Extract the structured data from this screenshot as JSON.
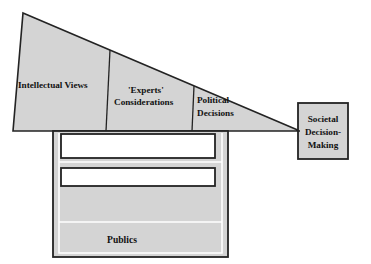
{
  "diagram": {
    "colors": {
      "fill_gray": "#d4d4d4",
      "stroke_dark": "#232323",
      "highlight_white": "#ffffff",
      "bar_fill": "#ffffff",
      "text": "#111111",
      "background": "#ffffff"
    },
    "wedge": {
      "name": "knowledge-wedge",
      "segments": [
        {
          "id": "intellectual-views",
          "label": "Intellectual Views",
          "lines": [
            "Intellectual Views"
          ]
        },
        {
          "id": "experts-considerations",
          "label": "'Experts' Considerations",
          "lines": [
            "'Experts'",
            "Considerations"
          ]
        },
        {
          "id": "political-decisions",
          "label": "Political Decisions",
          "lines": [
            "Political",
            "Decisions"
          ]
        }
      ]
    },
    "column": {
      "name": "publics-column",
      "bars": [
        {
          "id": "empty-bar-top",
          "label": ""
        },
        {
          "id": "empty-bar-bottom",
          "label": ""
        }
      ],
      "base_label": "Publics"
    },
    "outcome_box": {
      "name": "societal-decision-making-box",
      "lines": [
        "Societal",
        "Decision-",
        "Making"
      ],
      "label": "Societal Decision-Making"
    }
  }
}
